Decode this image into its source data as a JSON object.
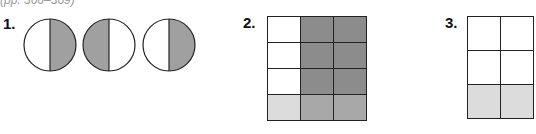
{
  "header": {
    "page_reference": "(pp. 366–369)"
  },
  "colors": {
    "stroke": "#222222",
    "circle_shade": "#a0a0a0",
    "dark_shade": "#8c8c8c",
    "light_shade": "#dcdcdc",
    "overlap_shade": "#a8a8a8",
    "white": "#ffffff"
  },
  "exercises": [
    {
      "number": "1.",
      "type": "circles",
      "items": [
        {
          "shaded_half": "right"
        },
        {
          "shaded_half": "left"
        },
        {
          "shaded_half": "right"
        }
      ]
    },
    {
      "number": "2.",
      "type": "grid",
      "columns": 3,
      "rows": 4,
      "cells": [
        [
          "white",
          "dark",
          "dark"
        ],
        [
          "white",
          "dark",
          "dark"
        ],
        [
          "white",
          "dark",
          "dark"
        ],
        [
          "light",
          "overlap",
          "overlap"
        ]
      ]
    },
    {
      "number": "3.",
      "type": "grid",
      "columns": 2,
      "rows": 3,
      "cells": [
        [
          "white",
          "white"
        ],
        [
          "white",
          "white"
        ],
        [
          "light",
          "light"
        ]
      ]
    }
  ]
}
